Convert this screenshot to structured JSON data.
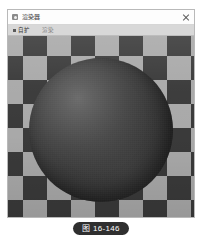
{
  "window": {
    "title": "渲染器",
    "icon": "app-window-icon",
    "close_label": "×",
    "menu": [
      {
        "label": "自扩",
        "state": "selected"
      },
      {
        "label": "渲染",
        "state": "normal"
      }
    ]
  },
  "viewport": {
    "subject": "shaded-sphere",
    "background": "checkerboard",
    "colors": {
      "checker_dark": "#3a3a3a",
      "checker_light": "#a9a9a9",
      "sphere_highlight": "#6e6e6e",
      "sphere_shadow": "#1f1f1f"
    }
  },
  "caption": {
    "text": "图 16-146"
  }
}
